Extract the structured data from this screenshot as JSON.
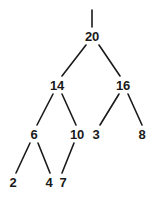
{
  "figure": {
    "type": "binary-tree-diagram",
    "title": "",
    "background_color": "#ffffff",
    "ink_color": "#1a1a1a",
    "width": 160,
    "height": 198
  },
  "nodes": [
    {
      "id": "n20",
      "label": "20",
      "x": 92,
      "y": 36,
      "level": 0
    },
    {
      "id": "n14",
      "label": "14",
      "x": 57,
      "y": 85,
      "level": 1
    },
    {
      "id": "n16",
      "label": "16",
      "x": 123,
      "y": 85,
      "level": 1
    },
    {
      "id": "n6",
      "label": "6",
      "x": 34,
      "y": 134,
      "level": 2
    },
    {
      "id": "n10",
      "label": "10",
      "x": 77,
      "y": 134,
      "level": 2
    },
    {
      "id": "n3",
      "label": "3",
      "x": 96,
      "y": 134,
      "level": 2
    },
    {
      "id": "n8",
      "label": "8",
      "x": 142,
      "y": 134,
      "level": 2
    },
    {
      "id": "n2",
      "label": "2",
      "x": 13,
      "y": 182,
      "level": 3
    },
    {
      "id": "n4",
      "label": "4",
      "x": 49,
      "y": 182,
      "level": 3
    },
    {
      "id": "n7",
      "label": "7",
      "x": 63,
      "y": 182,
      "level": 3
    }
  ],
  "edges": [
    {
      "id": "stub-root",
      "from": "root-stub",
      "to": "n20",
      "x1": 92,
      "y1": 10,
      "x2": 92,
      "y2": 27
    },
    {
      "id": "e20-14",
      "from": "n20",
      "to": "n14",
      "x1": 86,
      "y1": 45,
      "x2": 62,
      "y2": 76
    },
    {
      "id": "e20-16",
      "from": "n20",
      "to": "n16",
      "x1": 99,
      "y1": 45,
      "x2": 120,
      "y2": 76
    },
    {
      "id": "e14-6",
      "from": "n14",
      "to": "n6",
      "x1": 53,
      "y1": 94,
      "x2": 37,
      "y2": 125
    },
    {
      "id": "e14-10",
      "from": "n14",
      "to": "n10",
      "x1": 62,
      "y1": 94,
      "x2": 76,
      "y2": 125
    },
    {
      "id": "e16-3",
      "from": "n16",
      "to": "n3",
      "x1": 119,
      "y1": 94,
      "x2": 100,
      "y2": 125
    },
    {
      "id": "e16-8",
      "from": "n16",
      "to": "n8",
      "x1": 128,
      "y1": 94,
      "x2": 142,
      "y2": 125
    },
    {
      "id": "e6-2",
      "from": "n6",
      "to": "n2",
      "x1": 30,
      "y1": 143,
      "x2": 16,
      "y2": 173
    },
    {
      "id": "e6-4",
      "from": "n6",
      "to": "n4",
      "x1": 38,
      "y1": 143,
      "x2": 50,
      "y2": 173
    },
    {
      "id": "e10-7",
      "from": "n10",
      "to": "n7",
      "x1": 74,
      "y1": 143,
      "x2": 62,
      "y2": 173
    }
  ],
  "chart_data": {
    "type": "diagram",
    "title": "",
    "structure": "binary-tree",
    "root": "20",
    "tree": {
      "value": "20",
      "children": [
        {
          "value": "14",
          "children": [
            {
              "value": "6",
              "children": [
                {
                  "value": "2",
                  "children": []
                },
                {
                  "value": "4",
                  "children": []
                }
              ]
            },
            {
              "value": "10",
              "children": [
                {
                  "value": "7",
                  "children": []
                }
              ]
            }
          ]
        },
        {
          "value": "16",
          "children": [
            {
              "value": "3",
              "children": []
            },
            {
              "value": "8",
              "children": []
            }
          ]
        }
      ]
    },
    "node_values": [
      "20",
      "14",
      "16",
      "6",
      "10",
      "3",
      "8",
      "2",
      "4",
      "7"
    ],
    "levels": [
      [
        "20"
      ],
      [
        "14",
        "16"
      ],
      [
        "6",
        "10",
        "3",
        "8"
      ],
      [
        "2",
        "4",
        "7"
      ]
    ],
    "edge_pairs": [
      [
        "20",
        "14"
      ],
      [
        "20",
        "16"
      ],
      [
        "14",
        "6"
      ],
      [
        "14",
        "10"
      ],
      [
        "16",
        "3"
      ],
      [
        "16",
        "8"
      ],
      [
        "6",
        "2"
      ],
      [
        "6",
        "4"
      ],
      [
        "10",
        "7"
      ]
    ]
  }
}
